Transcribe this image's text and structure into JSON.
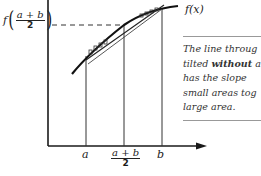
{
  "figure": {
    "curve_label": "f(x)",
    "y_label": {
      "func": "f",
      "numerator": "a + b",
      "denominator": "2"
    },
    "x_ticks": {
      "a": "a",
      "midpoint_numerator": "a + b",
      "midpoint_denominator": "2",
      "b": "b"
    }
  },
  "note": {
    "line1": "The line throug",
    "line2_pre": "tilted ",
    "line2_bold": "without",
    "line2_post": " a",
    "line3": "has the slope",
    "line4": "small areas tog",
    "line5": "large area."
  },
  "colors": {
    "ink": "#1a1a1a",
    "rule": "#999999",
    "background": "#ffffff"
  }
}
